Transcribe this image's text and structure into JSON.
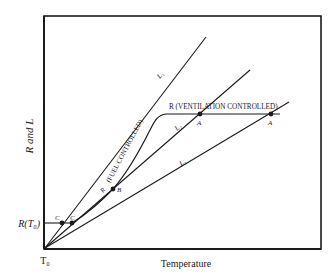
{
  "diagram": {
    "y_axis_label": "R and L",
    "x_axis_label": "Temperature",
    "origin_label": "T₀",
    "r_t0_label": "R(T₀)",
    "fuel_controlled_label": "(FUEL CONTROLLED)",
    "ventilation_controlled_label": "R (VENTILATION CONTROLLED)",
    "lines": [
      {
        "name": "L1",
        "label": "L₁"
      },
      {
        "name": "L2",
        "label": "L₂"
      },
      {
        "name": "L3",
        "label": "L₃"
      }
    ],
    "points": {
      "c1": "C",
      "c2": "C",
      "b_curve": "R",
      "b": "B",
      "a1": "A",
      "a2": "A"
    },
    "colors": {
      "ink": "#1a1a1a",
      "background": "#ffffff"
    }
  }
}
